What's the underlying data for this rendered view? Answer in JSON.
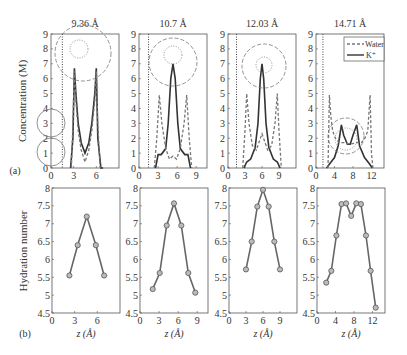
{
  "figure": {
    "panel_a_label": "(a)",
    "panel_b_label": "(b)",
    "ylabel_top": "Concentration (M)",
    "ylabel_bottom": "Hydration number",
    "xlabel_bottom": "z (Å)",
    "legend": {
      "water": "Water",
      "k": "K⁺"
    }
  },
  "chart_data": [
    {
      "type": "line",
      "panel": "a1",
      "title": "9.36 Å",
      "ylabel": "Concentration (M)",
      "xlim": [
        0,
        9
      ],
      "ylim": [
        0,
        9
      ],
      "xticks": [
        0,
        3,
        6
      ],
      "yticks": [
        0,
        1,
        2,
        3,
        4,
        5,
        6,
        7,
        8,
        9
      ],
      "series": [
        {
          "name": "K+",
          "style": "solid",
          "x": [
            2.6,
            2.9,
            3.1,
            3.3,
            3.6,
            4.0,
            4.5,
            5.0,
            5.4,
            5.8,
            6.0,
            6.2,
            6.6,
            6.9
          ],
          "y": [
            0,
            2,
            6.7,
            5,
            3,
            1.7,
            1.0,
            1.7,
            3,
            5,
            6.7,
            2,
            0,
            0
          ]
        },
        {
          "name": "Water",
          "style": "dashed",
          "x": [
            2.7,
            2.9,
            3.1,
            3.3,
            3.6,
            4.0,
            4.5,
            5.0,
            5.4,
            5.8,
            6.0,
            6.2,
            6.5
          ],
          "y": [
            0,
            3,
            6.5,
            4.5,
            2.5,
            1.2,
            0.4,
            1.2,
            2.5,
            4.5,
            6.5,
            3,
            0
          ]
        }
      ],
      "wall_line_x": 1.5
    },
    {
      "type": "line",
      "panel": "a2",
      "title": "10.7 Å",
      "xlim": [
        0,
        10.7
      ],
      "ylim": [
        0,
        9
      ],
      "xticks": [
        0,
        3,
        6,
        9
      ],
      "series": [
        {
          "name": "K+",
          "style": "solid",
          "x": [
            2.6,
            3.0,
            3.5,
            4.2,
            4.6,
            5.0,
            5.35,
            5.7,
            6.1,
            6.5,
            7.2,
            7.7,
            8.1
          ],
          "y": [
            0,
            0.9,
            0.9,
            1.3,
            3,
            6,
            7,
            6,
            3,
            1.3,
            0.9,
            0.9,
            0
          ]
        },
        {
          "name": "Water",
          "style": "dashed",
          "x": [
            2.4,
            2.8,
            3.2,
            3.6,
            4.2,
            4.8,
            5.35,
            5.9,
            6.5,
            7.1,
            7.5,
            7.9,
            8.3
          ],
          "y": [
            0,
            2,
            4.9,
            3,
            1.3,
            0.6,
            0.8,
            0.6,
            1.3,
            3,
            4.9,
            2,
            0
          ]
        }
      ],
      "wall_line_x": 1.5
    },
    {
      "type": "line",
      "panel": "a3",
      "title": "12.03 Å",
      "xlim": [
        0,
        12
      ],
      "ylim": [
        0,
        9
      ],
      "xticks": [
        0,
        3,
        6,
        9
      ],
      "series": [
        {
          "name": "K+",
          "style": "solid",
          "x": [
            2.8,
            3.3,
            4.0,
            4.8,
            5.3,
            5.7,
            6.0,
            6.3,
            6.7,
            7.2,
            8.0,
            8.7,
            9.2
          ],
          "y": [
            0,
            0.4,
            0.6,
            1.4,
            3,
            6,
            7,
            6,
            3,
            1.4,
            0.6,
            0.4,
            0
          ]
        },
        {
          "name": "Water",
          "style": "dashed",
          "x": [
            2.6,
            3.0,
            3.3,
            3.7,
            4.3,
            5.0,
            6.0,
            7.0,
            7.7,
            8.3,
            8.7,
            9.0,
            9.4
          ],
          "y": [
            0,
            2.5,
            5,
            3,
            1.5,
            1.2,
            2.3,
            1.2,
            1.5,
            3,
            5,
            2.5,
            0
          ]
        }
      ],
      "wall_line_x": 1.5
    },
    {
      "type": "line",
      "panel": "a4",
      "title": "14.71 Å",
      "xlim": [
        0,
        14.71
      ],
      "ylim": [
        0,
        9
      ],
      "xticks": [
        0,
        4,
        8,
        12
      ],
      "series": [
        {
          "name": "K+",
          "style": "solid",
          "x": [
            2.3,
            3.0,
            4.0,
            4.8,
            5.5,
            6.0,
            6.8,
            7.4,
            8.0,
            8.8,
            9.4,
            10.5,
            11.5,
            12.2
          ],
          "y": [
            0,
            0.3,
            0.7,
            1.5,
            2.9,
            2.2,
            1.6,
            1.6,
            2.2,
            2.9,
            1.5,
            0.7,
            0.3,
            0
          ]
        },
        {
          "name": "Water",
          "style": "dashed",
          "x": [
            2.6,
            2.9,
            3.2,
            3.6,
            4.2,
            5.0,
            6.0,
            7.4,
            8.8,
            9.8,
            10.6,
            11.2,
            11.7,
            12.0,
            12.3
          ],
          "y": [
            0,
            4.9,
            3.5,
            2.5,
            2,
            1.7,
            1.7,
            1.6,
            1.7,
            1.7,
            2,
            2.5,
            4.9,
            1,
            0
          ]
        }
      ],
      "wall_line_x": 1.5,
      "legend": [
        "Water",
        "K+"
      ],
      "legend_position": "upper right"
    },
    {
      "type": "line",
      "panel": "b1",
      "xlabel": "z (Å)",
      "ylabel": "Hydration number",
      "xlim": [
        0,
        9
      ],
      "ylim": [
        4.5,
        8
      ],
      "xticks": [
        0,
        3,
        6
      ],
      "yticks": [
        4.5,
        5,
        5.5,
        6,
        6.5,
        7,
        7.5,
        8
      ],
      "x": [
        2.3,
        3.4,
        4.6,
        5.8,
        6.9
      ],
      "y": [
        5.55,
        6.4,
        7.2,
        6.4,
        5.55
      ]
    },
    {
      "type": "line",
      "panel": "b2",
      "xlabel": "z (Å)",
      "xlim": [
        0,
        10.7
      ],
      "ylim": [
        4.5,
        8
      ],
      "xticks": [
        0,
        3,
        6,
        9
      ],
      "x": [
        2.0,
        3.1,
        4.2,
        5.35,
        6.5,
        7.6,
        8.7
      ],
      "y": [
        5.17,
        5.62,
        6.95,
        7.57,
        6.95,
        5.62,
        5.07
      ]
    },
    {
      "type": "line",
      "panel": "b3",
      "xlabel": "z (Å)",
      "xlim": [
        0,
        12
      ],
      "ylim": [
        4.5,
        8
      ],
      "xticks": [
        0,
        3,
        6,
        9
      ],
      "x": [
        3.0,
        4.0,
        5.0,
        6.0,
        7.0,
        8.0,
        9.0
      ],
      "y": [
        5.72,
        6.5,
        7.48,
        7.95,
        7.48,
        6.5,
        5.72
      ]
    },
    {
      "type": "line",
      "panel": "b4",
      "xlabel": "z (Å)",
      "xlim": [
        0,
        14.71
      ],
      "ylim": [
        4.5,
        8
      ],
      "xticks": [
        0,
        4,
        8,
        12
      ],
      "x": [
        2.0,
        3.1,
        4.2,
        5.3,
        6.3,
        7.4,
        8.5,
        9.5,
        10.6,
        11.6,
        12.7
      ],
      "y": [
        5.35,
        5.68,
        6.67,
        7.55,
        7.57,
        7.22,
        7.57,
        7.55,
        6.67,
        5.68,
        4.65
      ]
    }
  ]
}
